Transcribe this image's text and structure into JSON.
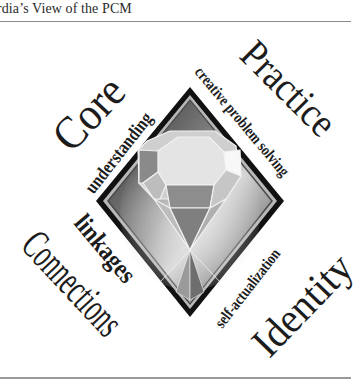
{
  "header": {
    "title": "rdia’s View of the PCM"
  },
  "diagram": {
    "corners": {
      "top_left": "Core",
      "top_right": "Practice",
      "bottom_left": "Connections",
      "bottom_right": "Identity"
    },
    "edges": {
      "upper_left": "understanding",
      "upper_right": "creative problem solving",
      "lower_left": "linkages",
      "lower_right": "self-actualization"
    },
    "center_graphic": "gem-in-diamond",
    "colors": {
      "text": "#1c1c1c",
      "diamond_border": "#111111",
      "diamond_inner_border": "#b5b5b5",
      "diamond_fill_dark": "#3a3a3a",
      "diamond_fill_light": "#d8d8d8",
      "gem_light": "#e6e6e6",
      "gem_mid": "#a8a8a8",
      "gem_dark": "#6e6e6e"
    }
  }
}
